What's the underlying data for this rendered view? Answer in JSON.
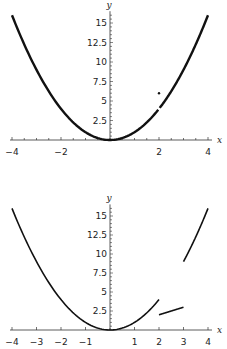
{
  "chart_data": [
    {
      "type": "line",
      "title": "",
      "xlabel": "x",
      "ylabel": "y",
      "xlim": [
        -4,
        4
      ],
      "ylim": [
        0,
        16
      ],
      "grid": false,
      "xticks": [
        -4,
        -2,
        2,
        4
      ],
      "xtick_labels": [
        "−4",
        "−2",
        "2",
        "4"
      ],
      "xminor_step": 0.5,
      "yticks": [
        2.5,
        5,
        7.5,
        10,
        12.5,
        15
      ],
      "ytick_labels": [
        "2.5",
        "5",
        "7.5",
        "10",
        "12.5",
        "15"
      ],
      "yminor_step": 0.5,
      "series": [
        {
          "name": "y = x^2 (x < 2)",
          "function": "x^2",
          "domain": [
            -4,
            1.97
          ],
          "stroke_width": 2.4
        },
        {
          "name": "y = x^2 (x > 2)",
          "function": "x^2",
          "domain": [
            2.03,
            4
          ],
          "stroke_width": 2.4
        }
      ],
      "points": [
        {
          "name": "isolated point",
          "x": 2,
          "y": 6
        }
      ],
      "annotations": [
        "hole at (2, 4)",
        "isolated point at (2, 6)"
      ],
      "frame": {
        "x0": 12,
        "x1": 208,
        "y0": 140,
        "ytop": 15.5,
        "px_per_y": 7.8,
        "xaxis_label_y": 155
      }
    },
    {
      "type": "line",
      "title": "",
      "xlabel": "x",
      "ylabel": "y",
      "xlim": [
        -4,
        4
      ],
      "ylim": [
        0,
        16
      ],
      "grid": false,
      "xticks": [
        -4,
        -3,
        -2,
        -1,
        1,
        2,
        3,
        4
      ],
      "xtick_labels": [
        "−4",
        "−3",
        "−2",
        "−1",
        "1",
        "2",
        "3",
        "4"
      ],
      "xminor_step": 1,
      "yticks": [
        2.5,
        5,
        7.5,
        10,
        12.5,
        15
      ],
      "ytick_labels": [
        "2.5",
        "5",
        "7.5",
        "10",
        "12.5",
        "15"
      ],
      "yminor_step": 0.5,
      "series": [
        {
          "name": "y = x^2 (x < 2)",
          "function": "x^2",
          "domain": [
            -4,
            2
          ],
          "stroke_width": 1.6
        },
        {
          "name": "y = x (2 ≤ x < 3)",
          "function": "x",
          "domain": [
            2,
            3
          ],
          "stroke_width": 1.6
        },
        {
          "name": "y = x^2 (3 ≤ x ≤ 4)",
          "function": "x^2",
          "domain": [
            3,
            4
          ],
          "stroke_width": 1.6
        }
      ],
      "points": [],
      "annotations": [
        "jump discontinuity at x = 2",
        "jump discontinuity at x = 3"
      ],
      "frame": {
        "x0": 12,
        "x1": 208,
        "y0": 330,
        "ytop": 15.5,
        "px_per_y": 7.6,
        "xaxis_label_y": 345
      }
    }
  ],
  "colors": {
    "curve": "#111111",
    "axis": "#333333",
    "text": "#222222"
  }
}
